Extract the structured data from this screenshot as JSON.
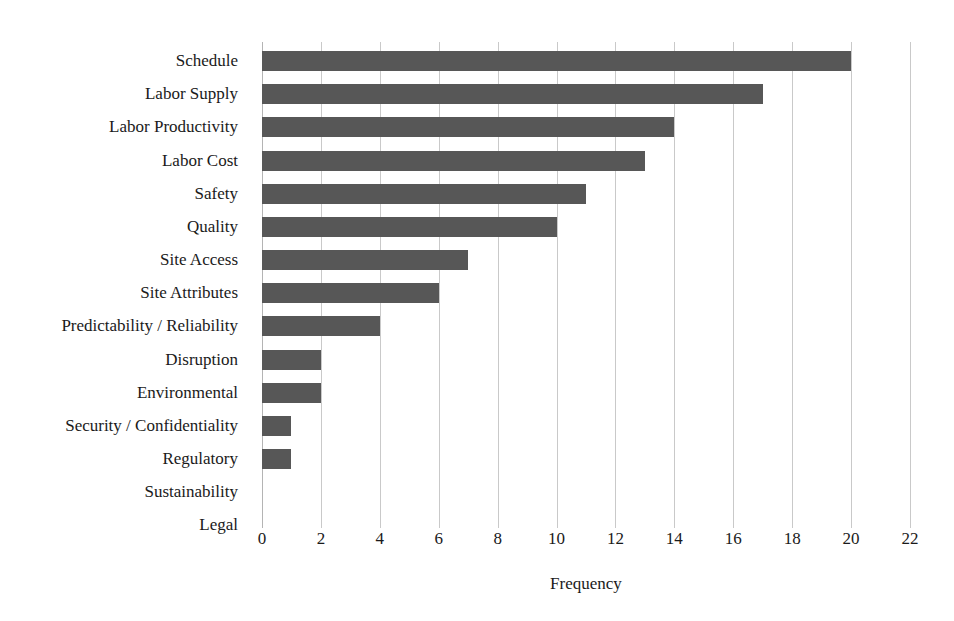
{
  "chart_data": {
    "type": "bar",
    "orientation": "horizontal",
    "title": "",
    "xlabel": "Frequency",
    "ylabel": "",
    "categories": [
      "Schedule",
      "Labor Supply",
      "Labor Productivity",
      "Labor Cost",
      "Safety",
      "Quality",
      "Site Access",
      "Site Attributes",
      "Predictability / Reliability",
      "Disruption",
      "Environmental",
      "Security / Confidentiality",
      "Regulatory",
      "Sustainability",
      "Legal"
    ],
    "values": [
      20,
      17,
      14,
      13,
      11,
      10,
      7,
      6,
      4,
      2,
      2,
      1,
      1,
      0,
      0
    ],
    "xlim": [
      0,
      22
    ],
    "xticks": [
      0,
      2,
      4,
      6,
      8,
      10,
      12,
      14,
      16,
      18,
      20,
      22
    ],
    "xtick_labels": [
      "0",
      "2",
      "4",
      "6",
      "8",
      "10",
      "12",
      "14",
      "16",
      "18",
      "20",
      "22"
    ],
    "xtick_step": 2,
    "grid": "vertical",
    "legend": "none",
    "bar_color": "#575757",
    "grid_color": "#c9c9c9",
    "background_color": "#ffffff",
    "text_color": "#1a1a1a"
  }
}
